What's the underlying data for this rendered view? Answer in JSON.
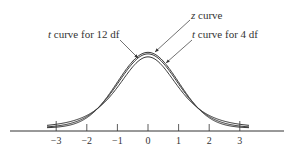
{
  "chart_data": {
    "type": "line",
    "title": "",
    "xlabel": "",
    "ylabel": "",
    "xlim": [
      -3.3,
      3.3
    ],
    "x_ticks": [
      -3,
      -2,
      -1,
      0,
      1,
      2,
      3
    ],
    "x_tick_labels": [
      "−3",
      "−2",
      "−1",
      "0",
      "1",
      "2",
      "3"
    ],
    "grid": false,
    "series": [
      {
        "name": "z curve",
        "distribution": "standard normal",
        "df": null
      },
      {
        "name": "t curve for 12 df",
        "distribution": "t",
        "df": 12
      },
      {
        "name": "t curve for 4 df",
        "distribution": "t",
        "df": 4
      }
    ],
    "annotations": [
      {
        "text_prefix": "z",
        "text_suffix": " curve",
        "target": "z curve"
      },
      {
        "text_prefix": "t",
        "text_suffix": " curve for 12 df",
        "target": "t curve for 12 df"
      },
      {
        "text_prefix": "t",
        "text_suffix": " curve for 4 df",
        "target": "t curve for 4 df"
      }
    ]
  },
  "labels": {
    "z": {
      "var": "z",
      "rest": " curve"
    },
    "t12": {
      "var": "t",
      "rest": " curve for 12 df"
    },
    "t4": {
      "var": "t",
      "rest": " curve for 4 df"
    }
  },
  "colors": {
    "line": "#333333",
    "text": "#333333"
  }
}
